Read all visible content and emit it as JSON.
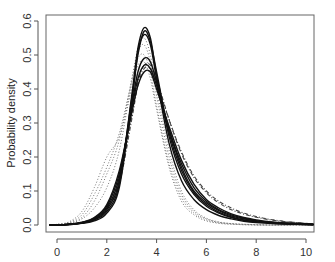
{
  "chart_data": {
    "type": "line",
    "title": "",
    "xlabel": "",
    "ylabel": "Probability density",
    "xlim": [
      -0.45,
      10.3
    ],
    "ylim": [
      -0.022,
      0.6
    ],
    "x_ticks": [
      0,
      2,
      4,
      6,
      8,
      10
    ],
    "y_ticks": [
      0.0,
      0.1,
      0.2,
      0.3,
      0.4,
      0.5,
      0.6
    ],
    "y_tick_labels": [
      "0.0",
      "0.1",
      "0.2",
      "0.3",
      "0.4",
      "0.5",
      "0.6"
    ],
    "x_tick_labels": [
      "0",
      "2",
      "4",
      "6",
      "8",
      "10"
    ],
    "grid": false,
    "legend": null,
    "x": [
      -0.3,
      0,
      0.5,
      1,
      1.5,
      2,
      2.5,
      3,
      3.25,
      3.5,
      3.75,
      4,
      4.5,
      5,
      5.5,
      6,
      6.5,
      7,
      7.5,
      8,
      8.5,
      9,
      9.5,
      10,
      10.3
    ],
    "series": [
      {
        "name": "solid-1",
        "style": "solid",
        "values": [
          0,
          0,
          0.002,
          0.006,
          0.015,
          0.04,
          0.12,
          0.38,
          0.52,
          0.58,
          0.55,
          0.44,
          0.26,
          0.15,
          0.09,
          0.055,
          0.035,
          0.022,
          0.014,
          0.009,
          0.006,
          0.004,
          0.003,
          0.002,
          0.001
        ]
      },
      {
        "name": "solid-2",
        "style": "solid",
        "values": [
          0,
          0,
          0.002,
          0.006,
          0.016,
          0.045,
          0.13,
          0.37,
          0.5,
          0.57,
          0.54,
          0.45,
          0.27,
          0.16,
          0.095,
          0.06,
          0.038,
          0.024,
          0.015,
          0.01,
          0.007,
          0.005,
          0.003,
          0.002,
          0.001
        ]
      },
      {
        "name": "solid-3",
        "style": "solid",
        "values": [
          0,
          0,
          0.002,
          0.007,
          0.018,
          0.05,
          0.14,
          0.35,
          0.45,
          0.49,
          0.48,
          0.42,
          0.28,
          0.17,
          0.1,
          0.065,
          0.042,
          0.027,
          0.018,
          0.012,
          0.008,
          0.006,
          0.004,
          0.003,
          0.002
        ]
      },
      {
        "name": "solid-4",
        "style": "solid",
        "values": [
          0,
          0,
          0.002,
          0.007,
          0.02,
          0.055,
          0.15,
          0.34,
          0.43,
          0.47,
          0.46,
          0.41,
          0.28,
          0.18,
          0.11,
          0.07,
          0.045,
          0.03,
          0.02,
          0.013,
          0.009,
          0.006,
          0.004,
          0.003,
          0.002
        ]
      },
      {
        "name": "solid-5",
        "style": "solid",
        "values": [
          0,
          0,
          0.002,
          0.008,
          0.022,
          0.06,
          0.16,
          0.33,
          0.41,
          0.45,
          0.45,
          0.4,
          0.29,
          0.19,
          0.12,
          0.075,
          0.05,
          0.033,
          0.022,
          0.015,
          0.01,
          0.007,
          0.005,
          0.003,
          0.002
        ]
      },
      {
        "name": "solid-6",
        "style": "solid",
        "values": [
          0,
          0,
          0.001,
          0.005,
          0.012,
          0.035,
          0.11,
          0.36,
          0.51,
          0.56,
          0.53,
          0.43,
          0.24,
          0.13,
          0.075,
          0.045,
          0.028,
          0.018,
          0.011,
          0.007,
          0.005,
          0.003,
          0.002,
          0.001,
          0.001
        ]
      },
      {
        "name": "dashed-1",
        "style": "dashed",
        "values": [
          0,
          0,
          0.002,
          0.006,
          0.017,
          0.05,
          0.13,
          0.32,
          0.42,
          0.47,
          0.47,
          0.43,
          0.31,
          0.21,
          0.14,
          0.095,
          0.065,
          0.045,
          0.032,
          0.023,
          0.016,
          0.011,
          0.008,
          0.005,
          0.003
        ]
      },
      {
        "name": "dashed-2",
        "style": "dashed",
        "values": [
          0,
          0,
          0.002,
          0.006,
          0.016,
          0.048,
          0.12,
          0.31,
          0.41,
          0.46,
          0.46,
          0.42,
          0.31,
          0.215,
          0.145,
          0.1,
          0.07,
          0.05,
          0.035,
          0.025,
          0.017,
          0.012,
          0.008,
          0.005,
          0.003
        ]
      },
      {
        "name": "dotted-1",
        "style": "dotted",
        "values": [
          0,
          0.002,
          0.01,
          0.04,
          0.11,
          0.2,
          0.26,
          0.4,
          0.47,
          0.48,
          0.43,
          0.34,
          0.17,
          0.07,
          0.03,
          0.012,
          0.005,
          0.002,
          0.001,
          0,
          0,
          0,
          0,
          0,
          0
        ]
      },
      {
        "name": "dotted-2",
        "style": "dotted",
        "values": [
          0,
          0.002,
          0.008,
          0.03,
          0.09,
          0.17,
          0.27,
          0.42,
          0.49,
          0.5,
          0.45,
          0.35,
          0.18,
          0.08,
          0.035,
          0.015,
          0.006,
          0.003,
          0.001,
          0,
          0,
          0,
          0,
          0,
          0
        ]
      },
      {
        "name": "dotted-3",
        "style": "dotted",
        "values": [
          0,
          0.001,
          0.006,
          0.022,
          0.07,
          0.15,
          0.25,
          0.43,
          0.51,
          0.53,
          0.48,
          0.38,
          0.2,
          0.09,
          0.04,
          0.018,
          0.008,
          0.004,
          0.002,
          0.001,
          0,
          0,
          0,
          0,
          0
        ]
      },
      {
        "name": "dotted-4",
        "style": "dotted",
        "values": [
          0,
          0.001,
          0.005,
          0.018,
          0.05,
          0.11,
          0.22,
          0.42,
          0.52,
          0.55,
          0.5,
          0.4,
          0.22,
          0.1,
          0.045,
          0.02,
          0.009,
          0.004,
          0.002,
          0.001,
          0,
          0,
          0,
          0,
          0
        ]
      }
    ]
  },
  "colors": {
    "solid": "#111111",
    "dashed": "#444444",
    "dotted": "#777777",
    "axis": "#555555"
  }
}
